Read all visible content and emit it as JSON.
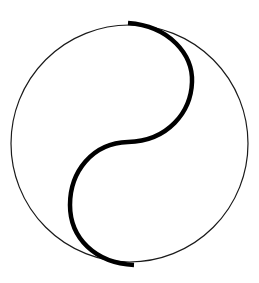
{
  "figure": {
    "description": "Yin-yang outline symbol: thin outer circle divided by a thick S-shaped curve",
    "icon": "yin-yang-icon",
    "outer_circle": {
      "cx": 129.5,
      "cy": 143.5,
      "r": 118.5,
      "stroke": "#1a1a1a",
      "stroke_width": 1.2
    },
    "s_curve": {
      "stroke": "#000000",
      "stroke_width": 4.5,
      "upper_arc": {
        "from": [
          130,
          23
        ],
        "to": [
          128,
          142
        ],
        "bulge_x": 192
      },
      "lower_arc": {
        "from": [
          128,
          142
        ],
        "to": [
          132,
          264
        ],
        "bulge_x": 70
      }
    },
    "background": "#ffffff"
  }
}
